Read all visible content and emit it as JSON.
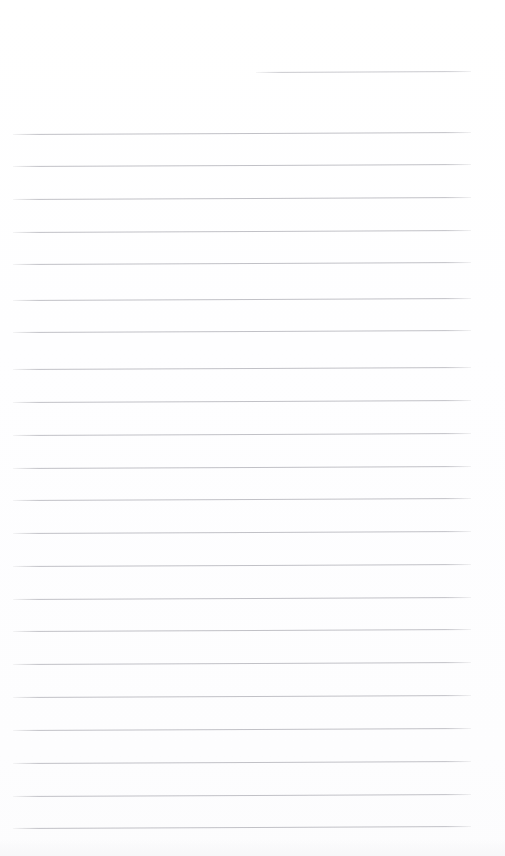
{
  "page": {
    "kind": "scanned-lined-paper",
    "width": 505,
    "height": 856,
    "background_color": "#fefeff",
    "visible_text": "",
    "note": ""
  },
  "ruling": {
    "line_color": "#bcbcc2",
    "line_thickness_px": 1,
    "line_spacing_px": 32.6,
    "full_line_left_px": 13,
    "full_line_right_px": 471,
    "skew_deg": -0.25,
    "total_line_count": 23,
    "full_line_count": 22,
    "partial_line_count": 1
  },
  "lines": [
    {
      "index": 1,
      "y": 72,
      "x": 256,
      "width": 215,
      "partial": true
    },
    {
      "index": 2,
      "y": 134,
      "x": 13,
      "width": 458,
      "partial": false
    },
    {
      "index": 3,
      "y": 166,
      "x": 13,
      "width": 458,
      "partial": false
    },
    {
      "index": 4,
      "y": 199,
      "x": 13,
      "width": 458,
      "partial": false
    },
    {
      "index": 5,
      "y": 232,
      "x": 13,
      "width": 458,
      "partial": false
    },
    {
      "index": 6,
      "y": 264,
      "x": 13,
      "width": 458,
      "partial": false
    },
    {
      "index": 7,
      "y": 300,
      "x": 13,
      "width": 458,
      "partial": false
    },
    {
      "index": 8,
      "y": 332,
      "x": 13,
      "width": 458,
      "partial": false
    },
    {
      "index": 9,
      "y": 369,
      "x": 13,
      "width": 458,
      "partial": false
    },
    {
      "index": 10,
      "y": 402,
      "x": 13,
      "width": 458,
      "partial": false
    },
    {
      "index": 11,
      "y": 435,
      "x": 13,
      "width": 458,
      "partial": false
    },
    {
      "index": 12,
      "y": 468,
      "x": 13,
      "width": 458,
      "partial": false
    },
    {
      "index": 13,
      "y": 500,
      "x": 13,
      "width": 458,
      "partial": false
    },
    {
      "index": 14,
      "y": 533,
      "x": 13,
      "width": 458,
      "partial": false
    },
    {
      "index": 15,
      "y": 566,
      "x": 13,
      "width": 458,
      "partial": false
    },
    {
      "index": 16,
      "y": 599,
      "x": 13,
      "width": 458,
      "partial": false
    },
    {
      "index": 17,
      "y": 631,
      "x": 13,
      "width": 458,
      "partial": false
    },
    {
      "index": 18,
      "y": 664,
      "x": 13,
      "width": 458,
      "partial": false
    },
    {
      "index": 19,
      "y": 697,
      "x": 13,
      "width": 458,
      "partial": false
    },
    {
      "index": 20,
      "y": 730,
      "x": 13,
      "width": 458,
      "partial": false
    },
    {
      "index": 21,
      "y": 763,
      "x": 13,
      "width": 458,
      "partial": false
    },
    {
      "index": 22,
      "y": 796,
      "x": 13,
      "width": 458,
      "partial": false
    },
    {
      "index": 23,
      "y": 828,
      "x": 13,
      "width": 458,
      "partial": false
    }
  ]
}
